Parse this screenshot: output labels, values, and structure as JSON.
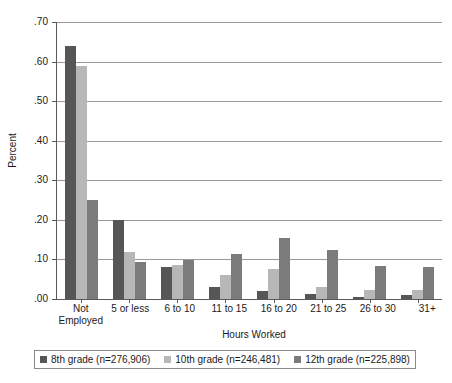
{
  "chart_data": {
    "type": "bar",
    "title": "",
    "xlabel": "Hours Worked",
    "ylabel": "Percent",
    "ylim": [
      0.0,
      0.7
    ],
    "grid": true,
    "legend_position": "bottom",
    "ytick_labels": [
      ".70",
      ".60",
      ".50",
      ".40",
      ".30",
      ".20",
      ".10",
      ".00"
    ],
    "ytick_values": [
      0.7,
      0.6,
      0.5,
      0.4,
      0.3,
      0.2,
      0.1,
      0.0
    ],
    "categories": [
      "Not Employed",
      "5 or less",
      "6 to 10",
      "11 to 15",
      "16 to 20",
      "21 to 25",
      "26 to 30",
      "31+"
    ],
    "category_lines": [
      [
        "Not",
        "Employed"
      ],
      [
        "5 or less",
        ""
      ],
      [
        "6 to 10",
        ""
      ],
      [
        "11 to 15",
        ""
      ],
      [
        "16 to 20",
        ""
      ],
      [
        "21 to 25",
        ""
      ],
      [
        "26 to 30",
        ""
      ],
      [
        "31+",
        ""
      ]
    ],
    "series": [
      {
        "name": "8th grade (n=276,906)",
        "color": "#565656",
        "values": [
          0.64,
          0.2,
          0.081,
          0.03,
          0.02,
          0.012,
          0.006,
          0.01
        ]
      },
      {
        "name": "10th grade (n=246,481)",
        "color": "#b7b7b7",
        "values": [
          0.59,
          0.12,
          0.085,
          0.06,
          0.075,
          0.03,
          0.022,
          0.022
        ]
      },
      {
        "name": "12th grade (n=225,898)",
        "color": "#7b7b7b",
        "values": [
          0.25,
          0.094,
          0.099,
          0.114,
          0.155,
          0.123,
          0.084,
          0.082
        ]
      }
    ]
  },
  "legend": {
    "items": [
      {
        "label": "8th grade (n=276,906)"
      },
      {
        "label": "10th grade (n=246,481)"
      },
      {
        "label": "12th grade (n=225,898)"
      }
    ]
  }
}
